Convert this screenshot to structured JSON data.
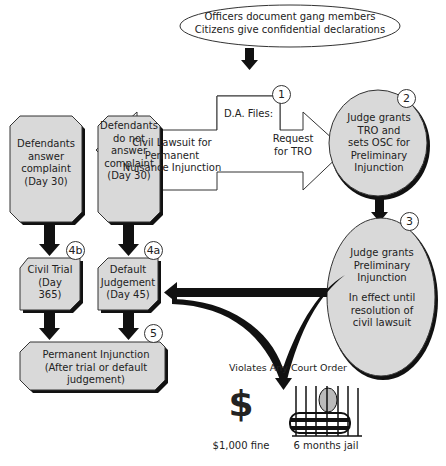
{
  "colors": {
    "box_fill": "#d9d9d9",
    "box_shadow": "#111111",
    "arrow": "#111111",
    "outline": "#333333",
    "background": "#ffffff"
  },
  "source": {
    "line1": "Officers document gang members",
    "line2": "Citizens give confidential declarations"
  },
  "step1": {
    "number": "1",
    "title": "D.A. Files:",
    "left": "Civil Lawsuit for Permanent Nuisance Injunction",
    "right": "Request for TRO"
  },
  "step2": {
    "number": "2",
    "text": "Judge grants TRO and sets OSC for Preliminary Injunction"
  },
  "step3": {
    "number": "3",
    "text": "Judge grants Preliminary Injunction",
    "text2": "In effect until resolution of civil lawsuit"
  },
  "answer": {
    "text": "Defendants answer complaint (Day 30)"
  },
  "no_answer": {
    "text": "Defendants do not answer complaint (Day 30)"
  },
  "step4b": {
    "number": "4b",
    "text": "Civil Trial (Day 365)"
  },
  "step4a": {
    "number": "4a",
    "text": "Default Judgement (Day 45)"
  },
  "step5": {
    "number": "5",
    "text": "Permanent Injunction (After trial or default judgement)"
  },
  "violation": {
    "title": "Violates Any Court Order",
    "fine_label": "$1,000 fine",
    "fine_icon": "$",
    "jail_label": "6 months jail"
  }
}
